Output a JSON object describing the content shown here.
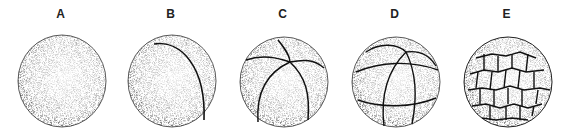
{
  "figure": {
    "panels": [
      {
        "label": "A",
        "stage": "single cell (uncleaved)",
        "cells": 1
      },
      {
        "label": "B",
        "stage": "2-cell",
        "cells": 2
      },
      {
        "label": "C",
        "stage": "4-cell",
        "cells": 4
      },
      {
        "label": "D",
        "stage": "8-cell",
        "cells": 8
      },
      {
        "label": "E",
        "stage": "morula",
        "cells": "many"
      }
    ],
    "colors": {
      "stipple": "#1a1a1a",
      "background": "#ffffff"
    }
  }
}
